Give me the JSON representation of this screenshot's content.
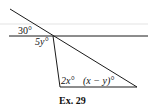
{
  "figure": {
    "caption": "Ex. 29",
    "angles": {
      "top_left": "30°",
      "intersection_below": "5y°",
      "triangle_bottom_left": "2x°",
      "triangle_bottom_right": "(x − y)°"
    },
    "colors": {
      "line": "#1a1a1a",
      "faint_line": "#d8d8d8"
    }
  }
}
